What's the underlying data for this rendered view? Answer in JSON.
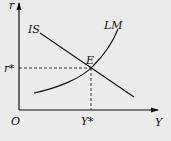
{
  "diagram": {
    "axes": {
      "y_label": "r",
      "x_label": "Y",
      "origin_label": "O"
    },
    "curves": [
      {
        "name": "IS",
        "label": "IS",
        "shape": "downward-sloping line"
      },
      {
        "name": "LM",
        "label": "LM",
        "shape": "upward-sloping convex curve"
      }
    ],
    "equilibrium": {
      "label": "E",
      "r_label": "r*",
      "y_label": "Y*"
    },
    "colors": {
      "background": "#ebebeb",
      "ink": "#111111"
    }
  }
}
